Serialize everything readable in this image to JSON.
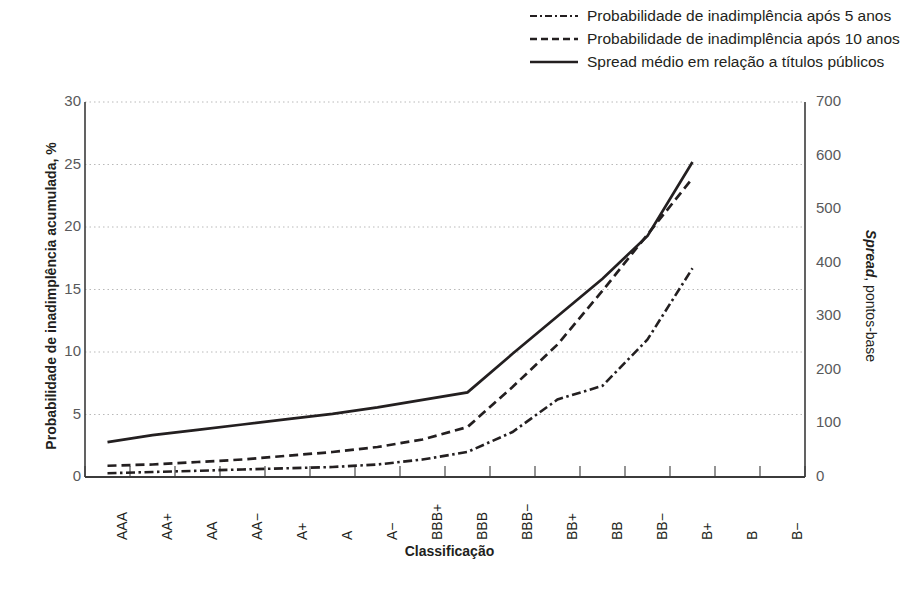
{
  "legend": {
    "items": [
      {
        "label": "Probabilidade de inadimplência após 5 anos",
        "style": "dash-dot"
      },
      {
        "label": "Probabilidade de inadimplência após 10 anos",
        "style": "dashed"
      },
      {
        "label": "Spread médio em relação a títulos públicos",
        "style": "solid"
      }
    ]
  },
  "axis": {
    "y_left_title": "Probabilidade de inadimplência acumulada, %",
    "y_right_title_bold": "Spread",
    "y_right_title_rest": ", pontos-base",
    "x_title": "Classificação",
    "y_left_ticks": [
      "0",
      "5",
      "10",
      "15",
      "20",
      "25",
      "30"
    ],
    "y_right_ticks": [
      "0",
      "100",
      "200",
      "300",
      "400",
      "500",
      "600",
      "700"
    ]
  },
  "colors": {
    "ink": "#231f20",
    "tick_text": "#58595b",
    "gridline": "#b9b9b9",
    "axis_line": "#3b3b3b"
  },
  "chart_data": {
    "type": "line",
    "title": "",
    "xlabel": "Classificação",
    "ylabel": "Probabilidade de inadimplência acumulada, %",
    "y2label": "Spread, pontos-base",
    "ylim": [
      0,
      30
    ],
    "y2lim": [
      0,
      700
    ],
    "grid": true,
    "legend_position": "top-right",
    "categories": [
      "AAA",
      "AA+",
      "AA",
      "AA−",
      "A+",
      "A",
      "A−",
      "BBB+",
      "BBB",
      "BBB−",
      "BB+",
      "BB",
      "BB−",
      "B+",
      "B",
      "B−"
    ],
    "series": [
      {
        "name": "Probabilidade de inadimplência após 5 anos",
        "style": "dash-dot",
        "axis": "left",
        "unit": "%",
        "values": [
          0.3,
          0.4,
          0.5,
          0.6,
          0.7,
          0.8,
          1.0,
          1.4,
          2.0,
          3.6,
          6.2,
          7.3,
          11.0,
          16.7,
          null,
          null
        ]
      },
      {
        "name": "Probabilidade de inadimplência após 10 anos",
        "style": "dashed",
        "axis": "left",
        "unit": "%",
        "values": [
          0.9,
          1.0,
          1.2,
          1.4,
          1.7,
          2.0,
          2.4,
          3.0,
          4.0,
          7.2,
          10.6,
          14.9,
          19.4,
          23.9,
          null,
          null
        ]
      },
      {
        "name": "Spread médio em relação a títulos públicos",
        "style": "solid",
        "axis": "right",
        "unit": "pontos-base",
        "values": [
          65,
          78,
          88,
          98,
          108,
          118,
          130,
          144,
          158,
          230,
          300,
          370,
          450,
          588,
          null,
          null
        ]
      }
    ]
  }
}
